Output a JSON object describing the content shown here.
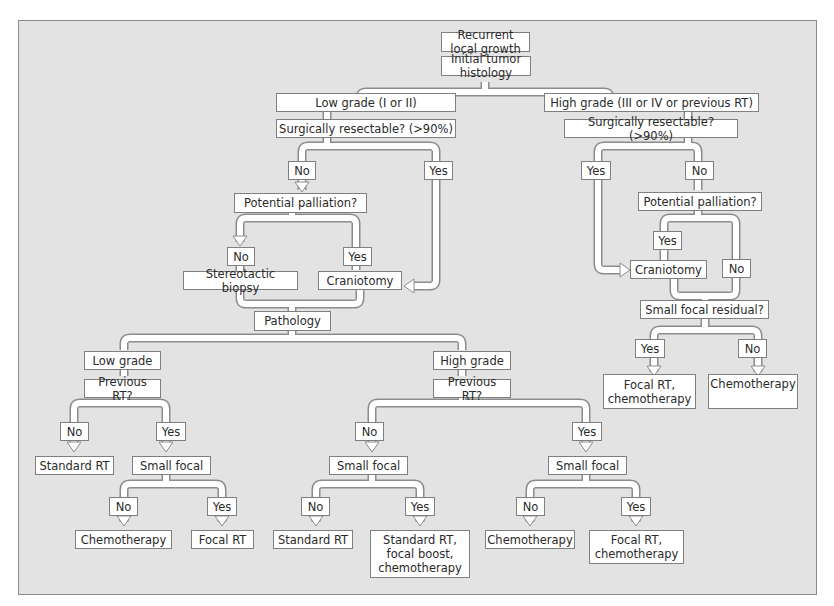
{
  "diagram": {
    "title": "Recurrent local growth",
    "colors": {
      "background": "#e3e3e3",
      "box_fill": "#ffffff",
      "box_border": "#7f7f7f",
      "pipe_outline": "#8c8c8c",
      "text": "#2a2a2a"
    },
    "nodes": {
      "root": "Recurrent local growth",
      "histology": "Initial tumor histology",
      "low_grade_initial": "Low grade (I or II)",
      "high_grade_initial": "High grade  (III or IV or previous RT)",
      "low_resectable": "Surgically resectable? (>90%)",
      "high_resectable": "Surgically resectable? (>90%)",
      "low_resect_no": "No",
      "low_resect_yes": "Yes",
      "high_resect_yes": "Yes",
      "high_resect_no": "No",
      "low_palliation": "Potential palliation?",
      "high_palliation": "Potential palliation?",
      "low_pall_no": "No",
      "low_pall_yes": "Yes",
      "high_pall_yes": "Yes",
      "high_pall_no": "No",
      "stereotactic_biopsy": "Stereotactic biopsy",
      "low_craniotomy": "Craniotomy",
      "high_craniotomy": "Craniotomy",
      "pathology": "Pathology",
      "small_focal_residual": "Small focal residual?",
      "residual_yes": "Yes",
      "residual_no": "No",
      "residual_yes_result": "Focal RT,\nchemotherapy",
      "residual_no_result": "Chemotherapy",
      "path_low_grade": "Low grade",
      "path_high_grade": "High grade",
      "low_prev_rt": "Previous RT?",
      "high_prev_rt": "Previous RT?",
      "low_prev_no": "No",
      "low_prev_yes": "Yes",
      "high_prev_no": "No",
      "high_prev_yes": "Yes",
      "low_standard_rt": "Standard RT",
      "low_small_focal": "Small focal",
      "high_small_focal_no": "Small focal",
      "high_small_focal_yes": "Small focal",
      "lsf_no": "No",
      "lsf_yes": "Yes",
      "hsfn_no": "No",
      "hsfn_yes": "Yes",
      "hsfy_no": "No",
      "hsfy_yes": "Yes",
      "lsf_no_result": "Chemotherapy",
      "lsf_yes_result": "Focal RT",
      "hsfn_no_result": "Standard RT",
      "hsfn_yes_result": "Standard RT,\nfocal boost,\nchemotherapy",
      "hsfy_no_result": "Chemotherapy",
      "hsfy_yes_result": "Focal RT,\nchemotherapy"
    }
  }
}
